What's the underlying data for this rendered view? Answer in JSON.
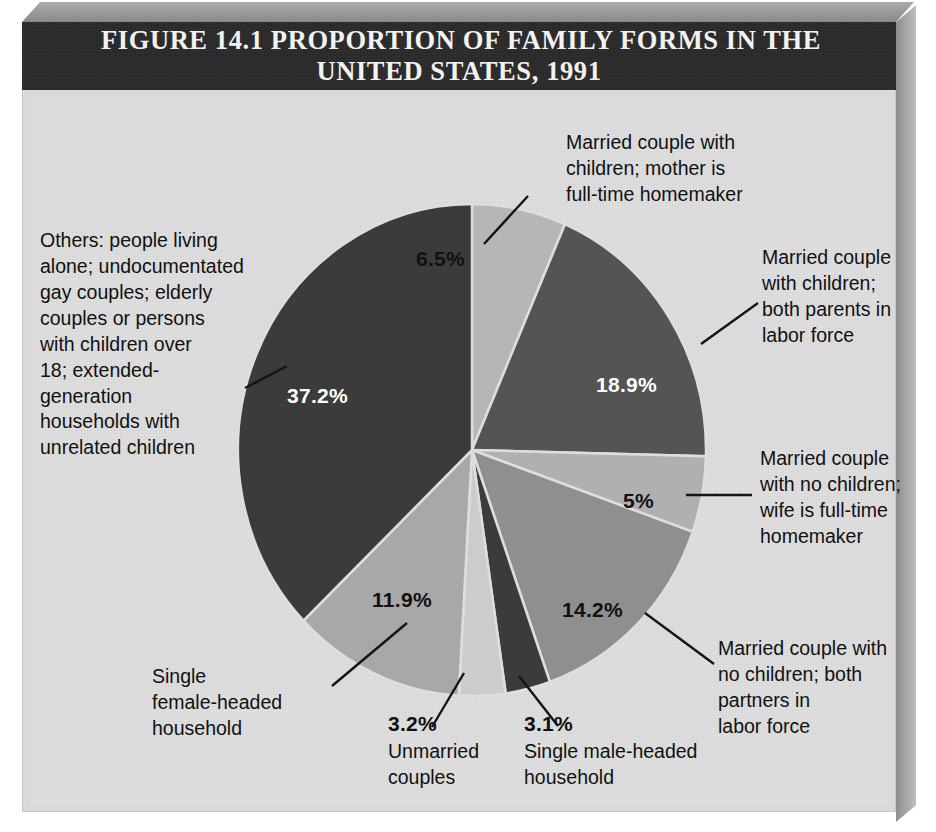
{
  "figure": {
    "title_line1": "FIGURE 14.1  PROPORTION OF FAMILY FORMS IN THE",
    "title_line2": "UNITED STATES, 1991"
  },
  "colors": {
    "frame_background": "#d9d9d9",
    "plate_background": "#dedede",
    "title_bar": "#2b2b2b",
    "title_text": "#f2f2f2",
    "label_text": "#111111",
    "slice_darkest": "#3b3b3b",
    "slice_dark": "#545454",
    "slice_medium": "#8f8f8f",
    "slice_light": "#b6b6b6",
    "slice_lightest": "#cccccc"
  },
  "chart_data": {
    "type": "pie",
    "title": "FIGURE 14.1  PROPORTION OF FAMILY FORMS IN THE UNITED STATES, 1991",
    "xlabel": "",
    "ylabel": "",
    "legend_position": "callout-labels",
    "grid": false,
    "start_angle_deg": 0,
    "direction": "clockwise",
    "categories": [
      "Married couple with children; mother is full-time homemaker",
      "Married couple with children; both parents in labor force",
      "Married couple with no children; wife is full-time homemaker",
      "Married couple with no children; both partners in labor force",
      "Single male-headed household",
      "Unmarried couples",
      "Single female-headed household",
      "Others: people living alone; undocumentated gay couples; elderly couples or persons with children over 18; extended-generation households with unrelated children"
    ],
    "values": [
      6.5,
      18.9,
      5.0,
      14.2,
      3.1,
      3.2,
      11.9,
      37.2
    ],
    "value_labels": [
      "6.5%",
      "18.9%",
      "5%",
      "14.2%",
      "3.1%",
      "3.2%",
      "11.9%",
      "37.2%"
    ],
    "slice_colors": [
      "#b6b6b6",
      "#545454",
      "#b0b0b0",
      "#8f8f8f",
      "#3b3b3b",
      "#cccccc",
      "#a8a8a8",
      "#3b3b3b"
    ],
    "value_label_colors": [
      "#111111",
      "#ffffff",
      "#111111",
      "#111111",
      "#111111",
      "#111111",
      "#111111",
      "#ffffff"
    ]
  },
  "slices": [
    {
      "id": "married-kids-homemaker",
      "pct": "6.5%",
      "label": "Married couple with\nchildren; mother is\nfull-time homemaker"
    },
    {
      "id": "married-kids-both",
      "pct": "18.9%",
      "label": "Married couple\nwith children;\nboth parents in\nlabor force"
    },
    {
      "id": "married-nokids-wife",
      "pct": "5%",
      "label": "Married couple\nwith no children;\nwife is full-time\nhomemaker"
    },
    {
      "id": "married-nokids-both",
      "pct": "14.2%",
      "label": "Married couple with\nno children; both\npartners in\nlabor force"
    },
    {
      "id": "single-male",
      "pct": "3.1%",
      "label": "Single male-headed\nhousehold"
    },
    {
      "id": "unmarried-couples",
      "pct": "3.2%",
      "label": "Unmarried\ncouples"
    },
    {
      "id": "single-female",
      "pct": "11.9%",
      "label": "Single\nfemale-headed\nhousehold"
    },
    {
      "id": "others",
      "pct": "37.2%",
      "label": "Others: people living\nalone; undocumentated\ngay couples; elderly\ncouples or persons\nwith children over\n18; extended-\ngeneration\nhouseholds with\nunrelated children"
    }
  ]
}
